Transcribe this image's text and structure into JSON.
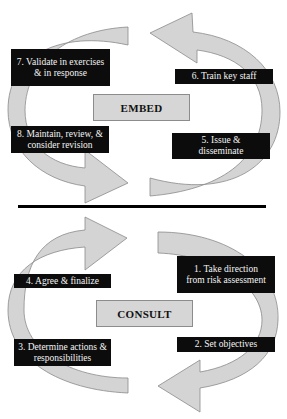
{
  "diagram": {
    "type": "two-phase cyclic process",
    "colors": {
      "arrow_fill": "#d4d4d4",
      "arrow_stroke": "#8a8a8a",
      "step_box": "#0c0c0c",
      "step_text": "#f4f4f4",
      "phase_box": "#d6d6d6",
      "divider": "#000000"
    },
    "embed": {
      "label": "EMBED",
      "steps": [
        {
          "id": "5",
          "label": "5. Issue & disseminate"
        },
        {
          "id": "6",
          "label": "6. Train key staff"
        },
        {
          "id": "7",
          "label": "7. Validate in exercises & in response"
        },
        {
          "id": "8",
          "label": "8. Maintain, review, & consider revision"
        }
      ]
    },
    "consult": {
      "label": "CONSULT",
      "steps": [
        {
          "id": "1",
          "label": "1. Take direction from risk assessment"
        },
        {
          "id": "2",
          "label": "2. Set objectives"
        },
        {
          "id": "3",
          "label": "3. Determine actions & responsibilities"
        },
        {
          "id": "4",
          "label": "4. Agree & finalize"
        }
      ]
    }
  }
}
